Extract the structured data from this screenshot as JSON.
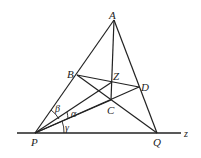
{
  "diagram": {
    "type": "geometry",
    "points": {
      "A": {
        "label": "A",
        "x": 114,
        "y": 20
      },
      "B": {
        "label": "B",
        "x": 77,
        "y": 75
      },
      "Z": {
        "label": "Z",
        "x": 112,
        "y": 82
      },
      "D": {
        "label": "D",
        "x": 139,
        "y": 87
      },
      "C": {
        "label": "C",
        "x": 111,
        "y": 100
      },
      "P": {
        "label": "P",
        "x": 35,
        "y": 133
      },
      "Q": {
        "label": "Q",
        "x": 157,
        "y": 133
      }
    },
    "line_label": "z",
    "angles": {
      "alpha": "α",
      "beta": "β",
      "gamma": "γ"
    },
    "colors": {
      "stroke": "#222222",
      "background": "#ffffff"
    }
  }
}
